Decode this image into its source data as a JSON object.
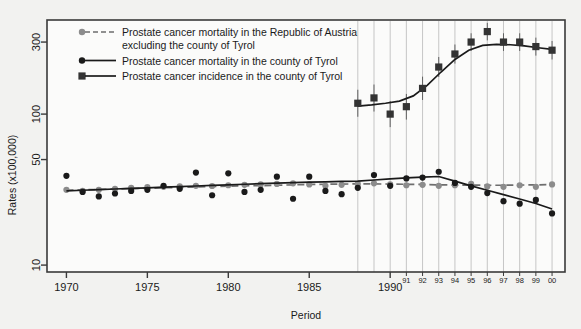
{
  "figure": {
    "background_color": "#f2f2f0",
    "plot_background_color": "#fbfbfa",
    "frame_color": "#3a3a3a"
  },
  "axes": {
    "y_title": "Rates (x100,000)",
    "x_title": "Period",
    "y_ticks": [
      "300",
      "100",
      "50",
      "10"
    ],
    "x_ticks_major": [
      "1970",
      "1975",
      "1980",
      "1985",
      "1990"
    ],
    "x_ticks_minor": [
      "91",
      "92",
      "93",
      "94",
      "95",
      "96",
      "97",
      "98",
      "99",
      "00"
    ]
  },
  "legend": {
    "entries": [
      {
        "label_line1": "Prostate cancer mortality in the Republic of Austria",
        "label_line2": "excluding the county of Tyrol",
        "marker": "circle",
        "marker_color": "#8c8c8c",
        "line_style": "dashed",
        "line_color": "#6e6e6e"
      },
      {
        "label_line1": "Prostate cancer mortality in the county of Tyrol",
        "label_line2": "",
        "marker": "circle",
        "marker_color": "#1a1a1a",
        "line_style": "solid",
        "line_color": "#1a1a1a"
      },
      {
        "label_line1": "Prostate cancer incidence in the county of Tyrol",
        "label_line2": "",
        "marker": "square",
        "marker_color": "#333333",
        "line_style": "solid",
        "line_color": "#1a1a1a"
      }
    ]
  },
  "chart_data": {
    "type": "scatter",
    "title": "",
    "subtitle": "",
    "xlabel": "Period",
    "ylabel": "Rates (x100,000)",
    "yscale": "log",
    "ylim": [
      9,
      420
    ],
    "xlim": [
      1968.8,
      2000.8
    ],
    "grid": "vertical gridlines from 1988 to 2000 only",
    "legend_position": "top-left inside plot",
    "series": [
      {
        "name": "Prostate cancer mortality in the Republic of Austria excluding the county of Tyrol",
        "key": "austria_mortality",
        "marker": "circle",
        "marker_color": "#8c8c8c",
        "line_style": "dashed",
        "line_color": "#6e6e6e",
        "x": [
          1970,
          1971,
          1972,
          1973,
          1974,
          1975,
          1976,
          1977,
          1978,
          1979,
          1980,
          1981,
          1982,
          1983,
          1984,
          1985,
          1986,
          1987,
          1988,
          1989,
          1990,
          1991,
          1992,
          1993,
          1994,
          1995,
          1996,
          1997,
          1998,
          1999,
          2000
        ],
        "points": [
          31.5,
          31.0,
          31.5,
          32.0,
          32.5,
          32.8,
          33.0,
          33.2,
          33.5,
          33.4,
          33.8,
          34.0,
          34.2,
          34.5,
          34.8,
          34.2,
          33.5,
          34.0,
          34.5,
          34.8,
          34.2,
          33.8,
          34.0,
          33.5,
          33.8,
          34.5,
          33.2,
          33.0,
          33.8,
          33.0,
          34.2
        ],
        "fit_line": [
          31.3,
          31.5,
          31.7,
          31.9,
          32.1,
          32.3,
          32.5,
          32.7,
          32.9,
          33.1,
          33.3,
          33.5,
          33.6,
          33.8,
          34.0,
          34.2,
          34.3,
          34.4,
          34.5,
          34.5,
          34.4,
          34.3,
          34.2,
          34.0,
          33.9,
          33.9,
          33.8,
          33.8,
          33.9,
          34.0,
          34.1
        ]
      },
      {
        "name": "Prostate cancer mortality in the county of Tyrol",
        "key": "tyrol_mortality",
        "marker": "circle",
        "marker_color": "#1a1a1a",
        "line_style": "solid",
        "line_color": "#1a1a1a",
        "x": [
          1970,
          1971,
          1972,
          1973,
          1974,
          1975,
          1976,
          1977,
          1978,
          1979,
          1980,
          1981,
          1982,
          1983,
          1984,
          1985,
          1986,
          1987,
          1988,
          1989,
          1990,
          1991,
          1992,
          1993,
          1994,
          1995,
          1996,
          1997,
          1998,
          1999,
          2000
        ],
        "points": [
          39.0,
          30.5,
          28.5,
          29.8,
          31.0,
          31.5,
          33.5,
          32.0,
          41.0,
          29.0,
          40.5,
          30.5,
          31.5,
          38.5,
          27.5,
          38.5,
          31.0,
          29.5,
          32.5,
          39.5,
          33.5,
          37.5,
          38.0,
          41.5,
          35.0,
          33.0,
          30.0,
          26.5,
          25.5,
          27.0,
          22.0
        ],
        "fit_line": [
          31.0,
          31.3,
          31.6,
          31.9,
          32.2,
          32.5,
          32.8,
          33.1,
          33.4,
          33.7,
          34.0,
          34.3,
          34.6,
          34.9,
          35.2,
          35.4,
          35.6,
          35.8,
          36.0,
          36.6,
          37.2,
          37.8,
          38.2,
          38.6,
          36.0,
          33.5,
          31.3,
          29.3,
          27.4,
          25.6,
          23.5
        ]
      },
      {
        "name": "Prostate cancer incidence in the county of Tyrol",
        "key": "tyrol_incidence",
        "marker": "square",
        "marker_color": "#333333",
        "line_style": "solid",
        "line_color": "#1a1a1a",
        "x": [
          1988,
          1989,
          1990,
          1991,
          1992,
          1993,
          1994,
          1995,
          1996,
          1997,
          1998,
          1999,
          2000
        ],
        "points": [
          118,
          128,
          100,
          112,
          148,
          205,
          250,
          300,
          352,
          300,
          300,
          280,
          280,
          265
        ],
        "values": [
          118,
          128,
          100,
          112,
          148,
          205,
          250,
          300,
          352,
          300,
          300,
          280,
          265
        ],
        "ci_low": [
          96,
          104,
          82,
          92,
          124,
          176,
          216,
          262,
          308,
          262,
          262,
          244,
          230
        ],
        "ci_high": [
          145,
          157,
          122,
          136,
          177,
          239,
          289,
          343,
          402,
          343,
          343,
          321,
          305
        ],
        "fit_line": [
          113,
          115,
          118,
          122,
          132,
          155,
          190,
          230,
          265,
          285,
          290,
          288,
          283,
          275,
          268
        ]
      }
    ]
  }
}
